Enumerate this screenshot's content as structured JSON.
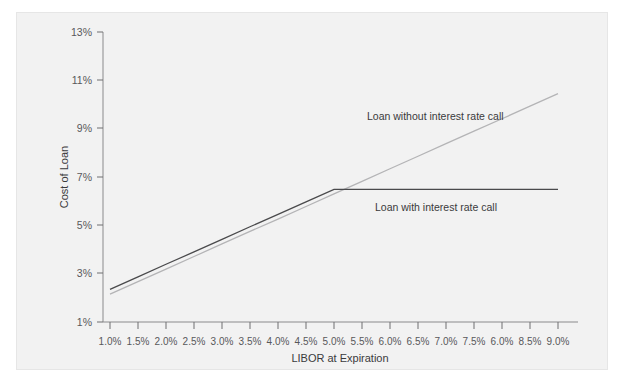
{
  "chart_data": {
    "type": "line",
    "title": "",
    "xlabel": "LIBOR at Expiration",
    "ylabel": "Cost of Loan",
    "grid": false,
    "legend_position": "inline-annotation",
    "xlim": [
      1.0,
      9.0
    ],
    "ylim": [
      1,
      13
    ],
    "x_tick_labels": [
      "1.0%",
      "1.5%",
      "2.0%",
      "2.5%",
      "3.0%",
      "3.5%",
      "4.0%",
      "4.5%",
      "5.0%",
      "5.5%",
      "6.0%",
      "6.5%",
      "7.0%",
      "7.5%",
      "6.0%",
      "8.5%",
      "9.0%"
    ],
    "x": [
      1.0,
      1.5,
      2.0,
      2.5,
      3.0,
      3.5,
      4.0,
      4.5,
      5.0,
      5.5,
      6.0,
      6.5,
      7.0,
      7.5,
      8.0,
      8.5,
      9.0
    ],
    "y_tick_labels": [
      "1%",
      "3%",
      "5%",
      "7%",
      "9%",
      "11%",
      "13%"
    ],
    "y_ticks": [
      1,
      3,
      5,
      7,
      9,
      11,
      13
    ],
    "series": [
      {
        "name": "Loan without interest rate call",
        "color": "#b4b4b6",
        "values": [
          2.15,
          2.67,
          3.19,
          3.71,
          4.23,
          4.75,
          5.26,
          5.78,
          6.3,
          6.82,
          7.34,
          7.86,
          8.38,
          8.9,
          9.41,
          9.93,
          10.45
        ]
      },
      {
        "name": "Loan with interest rate call",
        "color": "#4a4a4c",
        "values": [
          2.35,
          2.87,
          3.39,
          3.9,
          4.42,
          4.94,
          5.45,
          5.97,
          6.49,
          6.49,
          6.49,
          6.49,
          6.49,
          6.49,
          6.49,
          6.49,
          6.49
        ]
      }
    ],
    "annotations": [
      {
        "text": "Loan without interest rate call",
        "x_pct": 5.0,
        "y_pct": 9.1
      },
      {
        "text": "Loan with interest rate call",
        "x_pct": 5.6,
        "y_pct": 6.0
      }
    ],
    "kink": {
      "x": 5.0,
      "y": 6.49,
      "note": "cap strike where interest rate call caps cost of loan"
    }
  }
}
